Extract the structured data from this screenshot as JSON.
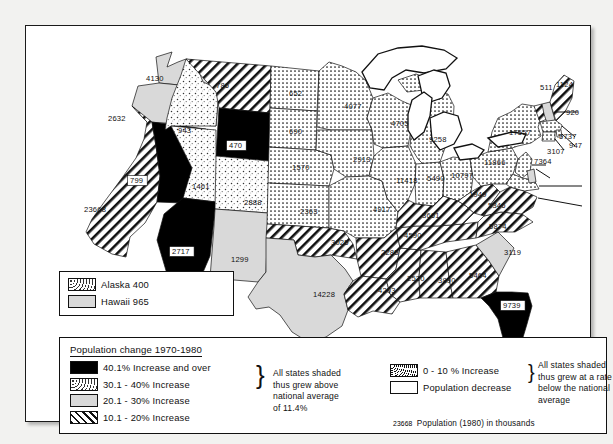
{
  "map": {
    "states": [
      {
        "code": "WA",
        "name": "Washington",
        "value": "4130",
        "class": "grey",
        "lx": 120,
        "ly": 55
      },
      {
        "code": "OR",
        "name": "Oregon",
        "value": "2632",
        "class": "grey",
        "lx": 82,
        "ly": 95
      },
      {
        "code": "CA",
        "name": "California",
        "value": "23668",
        "class": "hatch",
        "lx": 58,
        "ly": 186
      },
      {
        "code": "NV",
        "name": "Nevada",
        "value": "799",
        "class": "black",
        "lx": 104,
        "ly": 157
      },
      {
        "code": "ID",
        "name": "Idaho",
        "value": "943",
        "class": "coarse",
        "lx": 152,
        "ly": 107
      },
      {
        "code": "MT",
        "name": "Montana",
        "value": "786",
        "class": "hatch",
        "lx": 190,
        "ly": 62
      },
      {
        "code": "WY",
        "name": "Wyoming",
        "value": "470",
        "class": "black",
        "lx": 203,
        "ly": 122
      },
      {
        "code": "UT",
        "name": "Utah",
        "value": "1461",
        "class": "coarse",
        "lx": 166,
        "ly": 163
      },
      {
        "code": "AZ",
        "name": "Arizona",
        "value": "2717",
        "class": "black",
        "lx": 146,
        "ly": 228
      },
      {
        "code": "CO",
        "name": "Colorado",
        "value": "2888",
        "class": "coarse",
        "lx": 218,
        "ly": 179
      },
      {
        "code": "NM",
        "name": "New Mexico",
        "value": "1299",
        "class": "grey",
        "lx": 205,
        "ly": 236
      },
      {
        "code": "ND",
        "name": "North Dakota",
        "value": "652",
        "class": "fine",
        "lx": 263,
        "ly": 70
      },
      {
        "code": "SD",
        "name": "South Dakota",
        "value": "690",
        "class": "fine",
        "lx": 263,
        "ly": 108
      },
      {
        "code": "NE",
        "name": "Nebraska",
        "value": "1570",
        "class": "fine",
        "lx": 266,
        "ly": 144
      },
      {
        "code": "KS",
        "name": "Kansas",
        "value": "2363",
        "class": "fine",
        "lx": 274,
        "ly": 188
      },
      {
        "code": "OK",
        "name": "Oklahoma",
        "value": "3025",
        "class": "hatch",
        "lx": 305,
        "ly": 219
      },
      {
        "code": "TX",
        "name": "Texas",
        "value": "14228",
        "class": "grey",
        "lx": 287,
        "ly": 271
      },
      {
        "code": "MN",
        "name": "Minnesota",
        "value": "4077",
        "class": "fine",
        "lx": 318,
        "ly": 83
      },
      {
        "code": "IA",
        "name": "Iowa",
        "value": "2913",
        "class": "fine",
        "lx": 327,
        "ly": 136
      },
      {
        "code": "MO",
        "name": "Missouri",
        "value": "4917",
        "class": "fine",
        "lx": 347,
        "ly": 186
      },
      {
        "code": "AR",
        "name": "Arkansas",
        "value": "2285",
        "class": "hatch",
        "lx": 355,
        "ly": 229
      },
      {
        "code": "LA",
        "name": "Louisiana",
        "value": "4203",
        "class": "hatch",
        "lx": 352,
        "ly": 267
      },
      {
        "code": "WI",
        "name": "Wisconsin",
        "value": "4705",
        "class": "fine",
        "lx": 365,
        "ly": 100
      },
      {
        "code": "IL",
        "name": "Illinois",
        "value": "11418",
        "class": "fine",
        "lx": 370,
        "ly": 157
      },
      {
        "code": "MS",
        "name": "Mississippi",
        "value": "2520",
        "class": "hatch",
        "lx": 381,
        "ly": 255
      },
      {
        "code": "MI",
        "name": "Michigan",
        "value": "9258",
        "class": "fine",
        "lx": 403,
        "ly": 116
      },
      {
        "code": "IN",
        "name": "Indiana",
        "value": "5490",
        "class": "fine",
        "lx": 401,
        "ly": 155
      },
      {
        "code": "KY",
        "name": "Kentucky",
        "value": "3661",
        "class": "hatch",
        "lx": 396,
        "ly": 192
      },
      {
        "code": "TN",
        "name": "Tennessee",
        "value": "4590",
        "class": "hatch",
        "lx": 378,
        "ly": 212
      },
      {
        "code": "AL",
        "name": "Alabama",
        "value": "3890",
        "class": "hatch",
        "lx": 412,
        "ly": 257
      },
      {
        "code": "OH",
        "name": "Ohio",
        "value": "10797",
        "class": "fine",
        "lx": 425,
        "ly": 152
      },
      {
        "code": "WV",
        "name": "West Virginia",
        "value": "1949",
        "class": "hatch",
        "lx": 443,
        "ly": 171
      },
      {
        "code": "GA",
        "name": "Georgia",
        "value": "5464",
        "class": "hatch",
        "lx": 443,
        "ly": 252
      },
      {
        "code": "SC",
        "name": "South Carolina",
        "value": "3119",
        "class": "grey",
        "lx": 478,
        "ly": 229
      },
      {
        "code": "NC",
        "name": "North Carolina",
        "value": "5874",
        "class": "hatch",
        "lx": 463,
        "ly": 203
      },
      {
        "code": "VA",
        "name": "Virginia",
        "value": "5346",
        "class": "hatch",
        "lx": 462,
        "ly": 182
      },
      {
        "code": "PA",
        "name": "Pennsylvania",
        "value": "11866",
        "class": "fine",
        "lx": 458,
        "ly": 139
      },
      {
        "code": "NY",
        "name": "New York",
        "value": "17557",
        "class": "fine",
        "lx": 483,
        "ly": 109
      },
      {
        "code": "NJ",
        "name": "New Jersey",
        "value": "7364",
        "class": "leader",
        "lx": 508,
        "ly": 138
      },
      {
        "code": "CT",
        "name": "Connecticut",
        "value": "3107",
        "class": "leader",
        "lx": 521,
        "ly": 128
      },
      {
        "code": "RI",
        "name": "Rhode Island",
        "value": "947",
        "class": "leader",
        "lx": 543,
        "ly": 122
      },
      {
        "code": "MA",
        "name": "Massachusetts",
        "value": "5737",
        "class": "leader",
        "lx": 533,
        "ly": 113
      },
      {
        "code": "NH",
        "name": "New Hampshire",
        "value": "920",
        "class": "leader",
        "lx": 540,
        "ly": 89
      },
      {
        "code": "VT",
        "name": "Vermont",
        "value": "511",
        "class": "leader",
        "lx": 514,
        "ly": 64
      },
      {
        "code": "ME",
        "name": "Maine",
        "value": "1124",
        "class": "hatch",
        "lx": 530,
        "ly": 61
      },
      {
        "code": "DE",
        "name": "Delaware",
        "value": "595",
        "class": "leader",
        "lx": 563,
        "ly": 165
      },
      {
        "code": "MD",
        "name": "Maryland",
        "value": "4216",
        "class": "leader",
        "lx": 563,
        "ly": 184
      },
      {
        "code": "FL",
        "name": "Florida",
        "value": "9739",
        "class": "black",
        "lx": 477,
        "ly": 282
      }
    ]
  },
  "inset_box": {
    "alaska_label": "Alaska 400",
    "hawaii_label": "Hawaii 965"
  },
  "legend": {
    "title": "Population change 1970-1980",
    "left_items": [
      {
        "key": "black",
        "label": "40.1%  Increase and over"
      },
      {
        "key": "coarse",
        "label": "30.1 - 40% Increase"
      },
      {
        "key": "grey",
        "label": "20.1 - 30% Increase"
      },
      {
        "key": "hatch",
        "label": "10.1 - 20% Increase"
      }
    ],
    "left_note": [
      "All states shaded",
      "thus grew above",
      "national average",
      "of 11.4%"
    ],
    "right_items": [
      {
        "key": "fine",
        "label": "0 - 10 %  Increase"
      },
      {
        "key": "white",
        "label": "Population decrease"
      }
    ],
    "right_note": [
      "All states shaded",
      "thus grew at a rate",
      "below the national",
      "average"
    ],
    "footnote_number": "23668",
    "footnote_text": "Population  (1980) in thousands"
  },
  "colors": {
    "black": "#000000",
    "grey": "#d9d9d9",
    "white": "#ffffff",
    "outline": "#111111",
    "page_bg": "#f2f2f0"
  }
}
